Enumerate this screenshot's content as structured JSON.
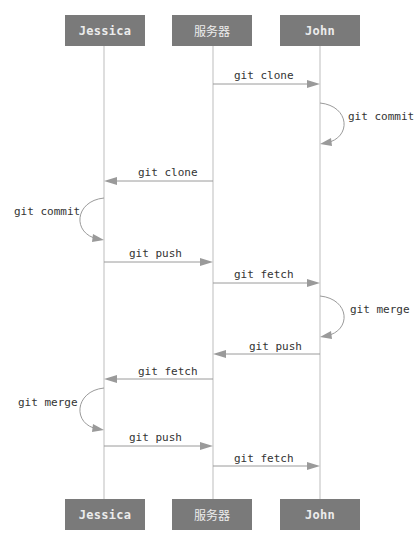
{
  "actors": [
    {
      "id": "jessica",
      "label": "Jessica",
      "x": 104
    },
    {
      "id": "server",
      "label": "服务器",
      "x": 213
    },
    {
      "id": "john",
      "label": "John",
      "x": 320
    }
  ],
  "colors": {
    "actor_box": "#7a7a7a",
    "actor_text": "#ececec",
    "lifeline": "#bdbdbd",
    "arrow": "#9a9a9a",
    "label_text": "#333333"
  },
  "messages": [
    {
      "label": "git clone",
      "from": "server",
      "to": "john",
      "y": 84
    },
    {
      "label": "git commit",
      "self": "john",
      "y_start": 103,
      "y_end": 143
    },
    {
      "label": "git clone",
      "from": "server",
      "to": "jessica",
      "y": 181
    },
    {
      "label": "git commit",
      "self": "jessica",
      "y_start": 198,
      "y_end": 240
    },
    {
      "label": "git push",
      "from": "jessica",
      "to": "server",
      "y": 262
    },
    {
      "label": "git fetch",
      "from": "server",
      "to": "john",
      "y": 283
    },
    {
      "label": "git merge",
      "self": "john",
      "y_start": 296,
      "y_end": 336
    },
    {
      "label": "git push",
      "from": "john",
      "to": "server",
      "y": 354
    },
    {
      "label": "git fetch",
      "from": "server",
      "to": "jessica",
      "y": 379
    },
    {
      "label": "git merge",
      "self": "jessica",
      "y_start": 388,
      "y_end": 430
    },
    {
      "label": "git push",
      "from": "jessica",
      "to": "server",
      "y": 446
    },
    {
      "label": "git fetch",
      "from": "server",
      "to": "john",
      "y": 466
    }
  ]
}
